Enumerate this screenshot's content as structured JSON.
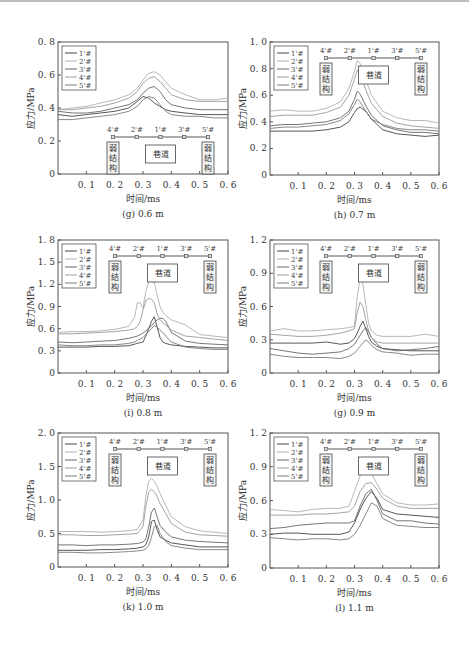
{
  "figure": {
    "panels_order": [
      "g06",
      "h07",
      "i08",
      "g09",
      "k10",
      "l11"
    ]
  },
  "common": {
    "xlabel": "时间/ms",
    "ylabel": "应力/MPa",
    "x_ticks": [
      0.1,
      0.2,
      0.3,
      0.4,
      0.5,
      0.6
    ],
    "x_tick_labels": [
      "0. 1",
      "0. 2",
      "0. 3",
      "0. 4",
      "0. 5",
      "0. 6"
    ],
    "legend": [
      "1'#",
      "2'#",
      "3'#",
      "4'#",
      "5'#"
    ],
    "inset": {
      "gauges": [
        "4'#",
        "2'#",
        "1'#",
        "3'#",
        "5'#"
      ],
      "weak_structure_label": "弱结构",
      "roadway_label": "巷道"
    }
  },
  "chart_data": [
    {
      "id": "g06",
      "type": "line",
      "title": "(g) 0.6 m",
      "xlabel": "时间/ms",
      "ylabel": "应力/MPa",
      "xlim": [
        0,
        0.6
      ],
      "ylim": [
        0,
        0.8
      ],
      "y_ticks": [
        0,
        0.2,
        0.4,
        0.6,
        0.8
      ],
      "y_tick_labels": [
        "0",
        "0. 2",
        "0. 4",
        "0. 6",
        "0. 8"
      ],
      "legend": [
        "1'#",
        "2'#",
        "3'#",
        "4'#",
        "5'#"
      ],
      "legend_position": "upper left",
      "inset_position": "bottom center",
      "x": [
        0,
        0.05,
        0.1,
        0.15,
        0.2,
        0.25,
        0.28,
        0.3,
        0.32,
        0.34,
        0.36,
        0.38,
        0.4,
        0.45,
        0.5,
        0.55,
        0.6
      ],
      "series": [
        {
          "name": "1'#",
          "values": [
            0.36,
            0.35,
            0.36,
            0.37,
            0.38,
            0.4,
            0.44,
            0.47,
            0.46,
            0.43,
            0.41,
            0.39,
            0.38,
            0.37,
            0.36,
            0.36,
            0.36
          ]
        },
        {
          "name": "2'#",
          "values": [
            0.39,
            0.4,
            0.41,
            0.43,
            0.45,
            0.48,
            0.52,
            0.57,
            0.61,
            0.62,
            0.6,
            0.56,
            0.52,
            0.48,
            0.45,
            0.45,
            0.46
          ]
        },
        {
          "name": "3'#",
          "values": [
            0.38,
            0.37,
            0.37,
            0.38,
            0.4,
            0.42,
            0.45,
            0.49,
            0.52,
            0.53,
            0.5,
            0.45,
            0.42,
            0.4,
            0.39,
            0.39,
            0.39
          ]
        },
        {
          "name": "4'#",
          "values": [
            0.39,
            0.39,
            0.4,
            0.41,
            0.43,
            0.46,
            0.5,
            0.55,
            0.58,
            0.59,
            0.56,
            0.52,
            0.48,
            0.45,
            0.44,
            0.44,
            0.44
          ]
        },
        {
          "name": "5'#",
          "values": [
            0.33,
            0.33,
            0.34,
            0.35,
            0.36,
            0.38,
            0.41,
            0.45,
            0.47,
            0.46,
            0.42,
            0.38,
            0.36,
            0.35,
            0.35,
            0.34,
            0.34
          ]
        }
      ]
    },
    {
      "id": "h07",
      "type": "line",
      "title": "(h) 0.7 m",
      "xlabel": "时间/ms",
      "ylabel": "应力/MPa",
      "xlim": [
        0,
        0.6
      ],
      "ylim": [
        0,
        1.0
      ],
      "y_ticks": [
        0,
        0.2,
        0.4,
        0.6,
        0.8,
        1.0
      ],
      "y_tick_labels": [
        "0",
        "0. 2",
        "0. 4",
        "0. 6",
        "0. 8",
        "1. 0"
      ],
      "legend": [
        "1'#",
        "2'#",
        "3'#",
        "4'#",
        "5'#"
      ],
      "legend_position": "upper left",
      "inset_position": "top right",
      "x": [
        0,
        0.05,
        0.1,
        0.15,
        0.2,
        0.25,
        0.28,
        0.3,
        0.31,
        0.32,
        0.34,
        0.36,
        0.4,
        0.45,
        0.5,
        0.55,
        0.6
      ],
      "series": [
        {
          "name": "1'#",
          "values": [
            0.33,
            0.33,
            0.33,
            0.33,
            0.34,
            0.36,
            0.4,
            0.47,
            0.5,
            0.51,
            0.48,
            0.42,
            0.34,
            0.31,
            0.3,
            0.29,
            0.3
          ]
        },
        {
          "name": "2'#",
          "values": [
            0.48,
            0.49,
            0.48,
            0.48,
            0.5,
            0.55,
            0.65,
            0.78,
            0.86,
            0.84,
            0.72,
            0.6,
            0.48,
            0.43,
            0.41,
            0.41,
            0.39
          ]
        },
        {
          "name": "3'#",
          "values": [
            0.37,
            0.38,
            0.38,
            0.39,
            0.4,
            0.43,
            0.48,
            0.57,
            0.63,
            0.61,
            0.52,
            0.45,
            0.37,
            0.34,
            0.32,
            0.32,
            0.31
          ]
        },
        {
          "name": "4'#",
          "values": [
            0.44,
            0.45,
            0.45,
            0.45,
            0.47,
            0.51,
            0.6,
            0.72,
            0.79,
            0.76,
            0.64,
            0.54,
            0.44,
            0.39,
            0.37,
            0.36,
            0.35
          ]
        },
        {
          "name": "5'#",
          "values": [
            0.35,
            0.36,
            0.36,
            0.37,
            0.38,
            0.41,
            0.46,
            0.53,
            0.57,
            0.55,
            0.48,
            0.42,
            0.38,
            0.35,
            0.34,
            0.34,
            0.33
          ]
        }
      ]
    },
    {
      "id": "i08",
      "type": "line",
      "title": "(i) 0.8 m",
      "xlabel": "时间/ms",
      "ylabel": "应力/MPa",
      "xlim": [
        0,
        0.6
      ],
      "ylim": [
        0,
        1.8
      ],
      "y_ticks": [
        0,
        0.3,
        0.6,
        0.9,
        1.2,
        1.5,
        1.8
      ],
      "y_tick_labels": [
        "0",
        "0. 3",
        "0. 6",
        "0. 9",
        "1. 2",
        "1. 5",
        "1. 8"
      ],
      "legend": [
        "1'#",
        "2'#",
        "3'#",
        "4'#",
        "5'#"
      ],
      "legend_position": "upper left",
      "inset_position": "top right",
      "x": [
        0,
        0.05,
        0.1,
        0.15,
        0.2,
        0.25,
        0.27,
        0.28,
        0.29,
        0.3,
        0.31,
        0.32,
        0.33,
        0.34,
        0.35,
        0.36,
        0.37,
        0.38,
        0.4,
        0.45,
        0.5,
        0.55,
        0.6
      ],
      "series": [
        {
          "name": "1'#",
          "values": [
            0.35,
            0.35,
            0.35,
            0.36,
            0.36,
            0.37,
            0.39,
            0.4,
            0.41,
            0.42,
            0.5,
            0.6,
            0.7,
            0.76,
            0.62,
            0.48,
            0.42,
            0.4,
            0.38,
            0.36,
            0.35,
            0.34,
            0.34
          ]
        },
        {
          "name": "2'#",
          "values": [
            0.55,
            0.56,
            0.56,
            0.57,
            0.59,
            0.63,
            0.75,
            0.95,
            0.95,
            0.88,
            1.1,
            1.23,
            1.24,
            1.22,
            1.05,
            0.9,
            0.82,
            0.78,
            0.72,
            0.65,
            0.52,
            0.5,
            0.48
          ]
        },
        {
          "name": "3'#",
          "values": [
            0.42,
            0.41,
            0.42,
            0.43,
            0.44,
            0.47,
            0.49,
            0.5,
            0.52,
            0.54,
            0.57,
            0.6,
            0.64,
            0.68,
            0.72,
            0.74,
            0.74,
            0.7,
            0.55,
            0.43,
            0.4,
            0.39,
            0.38
          ]
        },
        {
          "name": "4'#",
          "values": [
            0.53,
            0.53,
            0.54,
            0.55,
            0.56,
            0.58,
            0.6,
            0.63,
            0.7,
            0.85,
            0.98,
            1.01,
            1.0,
            0.95,
            0.8,
            0.72,
            0.68,
            0.65,
            0.58,
            0.5,
            0.48,
            0.46,
            0.44
          ]
        },
        {
          "name": "5'#",
          "values": [
            0.38,
            0.37,
            0.37,
            0.38,
            0.38,
            0.4,
            0.42,
            0.44,
            0.46,
            0.48,
            0.52,
            0.56,
            0.6,
            0.64,
            0.62,
            0.58,
            0.55,
            0.5,
            0.42,
            0.35,
            0.33,
            0.32,
            0.32
          ]
        }
      ]
    },
    {
      "id": "g09",
      "type": "line",
      "title": "(g) 0.9 m",
      "xlabel": "时间/ms",
      "ylabel": "应力/MPa",
      "xlim": [
        0,
        0.6
      ],
      "ylim": [
        0,
        1.2
      ],
      "y_ticks": [
        0,
        0.3,
        0.6,
        0.9,
        1.2
      ],
      "y_tick_labels": [
        "0",
        "0. 3",
        "0. 6",
        "0. 9",
        "1. 2"
      ],
      "legend": [
        "1'#",
        "2'#",
        "3'#",
        "4'#",
        "5'#"
      ],
      "legend_position": "upper left",
      "inset_position": "top right",
      "x": [
        0,
        0.05,
        0.1,
        0.15,
        0.2,
        0.25,
        0.28,
        0.3,
        0.31,
        0.32,
        0.33,
        0.34,
        0.35,
        0.36,
        0.38,
        0.4,
        0.45,
        0.5,
        0.55,
        0.6
      ],
      "series": [
        {
          "name": "1'#",
          "values": [
            0.27,
            0.27,
            0.27,
            0.27,
            0.28,
            0.26,
            0.27,
            0.31,
            0.36,
            0.42,
            0.47,
            0.4,
            0.33,
            0.28,
            0.24,
            0.22,
            0.21,
            0.2,
            0.2,
            0.2
          ]
        },
        {
          "name": "2'#",
          "values": [
            0.38,
            0.4,
            0.38,
            0.38,
            0.39,
            0.4,
            0.41,
            0.42,
            0.7,
            0.85,
            0.8,
            0.62,
            0.45,
            0.38,
            0.34,
            0.33,
            0.33,
            0.33,
            0.35,
            0.33
          ]
        },
        {
          "name": "3'#",
          "values": [
            0.22,
            0.2,
            0.18,
            0.17,
            0.18,
            0.19,
            0.22,
            0.26,
            0.3,
            0.34,
            0.38,
            0.41,
            0.37,
            0.32,
            0.26,
            0.22,
            0.2,
            0.21,
            0.22,
            0.24
          ]
        },
        {
          "name": "4'#",
          "values": [
            0.35,
            0.34,
            0.33,
            0.33,
            0.34,
            0.36,
            0.38,
            0.4,
            0.55,
            0.64,
            0.6,
            0.48,
            0.38,
            0.32,
            0.28,
            0.27,
            0.27,
            0.27,
            0.27,
            0.27
          ]
        },
        {
          "name": "5'#",
          "values": [
            0.17,
            0.15,
            0.14,
            0.14,
            0.14,
            0.13,
            0.15,
            0.18,
            0.21,
            0.24,
            0.27,
            0.3,
            0.28,
            0.25,
            0.21,
            0.19,
            0.18,
            0.16,
            0.17,
            0.17
          ]
        }
      ]
    },
    {
      "id": "k10",
      "type": "line",
      "title": "(k) 1.0 m",
      "xlabel": "时间/ms",
      "ylabel": "应力/MPa",
      "xlim": [
        0,
        0.6
      ],
      "ylim": [
        0,
        2.0
      ],
      "y_ticks": [
        0,
        0.5,
        1.0,
        1.5,
        2.0
      ],
      "y_tick_labels": [
        "0",
        "0. 5",
        "1. 0",
        "1. 5",
        "2. 0"
      ],
      "legend": [
        "1'#",
        "2'#",
        "3'#",
        "4'#",
        "5'#"
      ],
      "legend_position": "upper left",
      "inset_position": "top right",
      "x": [
        0,
        0.05,
        0.1,
        0.15,
        0.2,
        0.25,
        0.28,
        0.3,
        0.31,
        0.32,
        0.33,
        0.34,
        0.35,
        0.36,
        0.38,
        0.4,
        0.45,
        0.5,
        0.55,
        0.6
      ],
      "series": [
        {
          "name": "1'#",
          "values": [
            0.25,
            0.25,
            0.25,
            0.26,
            0.26,
            0.27,
            0.28,
            0.3,
            0.33,
            0.45,
            0.68,
            0.7,
            0.55,
            0.45,
            0.4,
            0.36,
            0.33,
            0.3,
            0.3,
            0.3
          ]
        },
        {
          "name": "2'#",
          "values": [
            0.53,
            0.53,
            0.53,
            0.52,
            0.53,
            0.54,
            0.56,
            0.7,
            1.05,
            1.28,
            1.32,
            1.28,
            1.2,
            1.1,
            0.92,
            0.75,
            0.6,
            0.54,
            0.52,
            0.5
          ]
        },
        {
          "name": "3'#",
          "values": [
            0.33,
            0.33,
            0.32,
            0.33,
            0.33,
            0.34,
            0.35,
            0.37,
            0.42,
            0.6,
            0.82,
            0.88,
            0.75,
            0.62,
            0.52,
            0.45,
            0.4,
            0.38,
            0.37,
            0.36
          ]
        },
        {
          "name": "4'#",
          "values": [
            0.48,
            0.48,
            0.47,
            0.47,
            0.48,
            0.49,
            0.5,
            0.6,
            0.9,
            1.12,
            1.16,
            1.12,
            1.05,
            0.95,
            0.8,
            0.65,
            0.52,
            0.48,
            0.47,
            0.46
          ]
        },
        {
          "name": "5'#",
          "values": [
            0.22,
            0.22,
            0.21,
            0.21,
            0.22,
            0.23,
            0.24,
            0.25,
            0.27,
            0.32,
            0.45,
            0.6,
            0.62,
            0.5,
            0.38,
            0.32,
            0.28,
            0.26,
            0.26,
            0.26
          ]
        }
      ]
    },
    {
      "id": "l11",
      "type": "line",
      "title": "(l) 1.1 m",
      "xlabel": "时间/ms",
      "ylabel": "应力/MPa",
      "xlim": [
        0,
        0.6
      ],
      "ylim": [
        0,
        1.2
      ],
      "y_ticks": [
        0,
        0.3,
        0.6,
        0.9,
        1.2
      ],
      "y_tick_labels": [
        "0",
        "0. 3",
        "0. 6",
        "0. 9",
        "1. 2"
      ],
      "legend": [
        "1'#",
        "2'#",
        "3'#",
        "4'#",
        "5'#"
      ],
      "legend_position": "upper left",
      "inset_position": "top right",
      "x": [
        0,
        0.05,
        0.1,
        0.15,
        0.2,
        0.25,
        0.28,
        0.3,
        0.32,
        0.34,
        0.36,
        0.38,
        0.4,
        0.45,
        0.5,
        0.55,
        0.6
      ],
      "series": [
        {
          "name": "1'#",
          "values": [
            0.3,
            0.31,
            0.31,
            0.3,
            0.3,
            0.3,
            0.32,
            0.4,
            0.52,
            0.62,
            0.68,
            0.62,
            0.52,
            0.48,
            0.47,
            0.46,
            0.45
          ]
        },
        {
          "name": "2'#",
          "values": [
            0.52,
            0.51,
            0.5,
            0.52,
            0.53,
            0.53,
            0.55,
            0.68,
            0.82,
            0.87,
            0.84,
            0.75,
            0.66,
            0.58,
            0.56,
            0.56,
            0.57
          ]
        },
        {
          "name": "3'#",
          "values": [
            0.35,
            0.36,
            0.38,
            0.39,
            0.4,
            0.4,
            0.4,
            0.42,
            0.55,
            0.66,
            0.7,
            0.6,
            0.48,
            0.42,
            0.42,
            0.4,
            0.39
          ]
        },
        {
          "name": "4'#",
          "values": [
            0.47,
            0.47,
            0.47,
            0.48,
            0.48,
            0.49,
            0.5,
            0.55,
            0.68,
            0.75,
            0.76,
            0.7,
            0.62,
            0.55,
            0.53,
            0.53,
            0.53
          ]
        },
        {
          "name": "5'#",
          "values": [
            0.27,
            0.26,
            0.25,
            0.26,
            0.26,
            0.25,
            0.26,
            0.3,
            0.38,
            0.48,
            0.58,
            0.55,
            0.44,
            0.38,
            0.37,
            0.36,
            0.36
          ]
        }
      ]
    }
  ],
  "styles": {
    "series_colors": [
      "#444444",
      "#b0b0b0",
      "#666666",
      "#9a9a9a",
      "#7a7a7a"
    ],
    "axis_color": "#555555"
  }
}
